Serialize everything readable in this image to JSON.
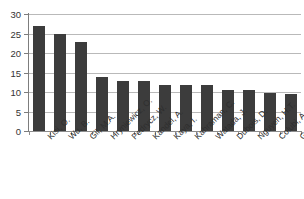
{
  "chart_data": {
    "type": "bar",
    "title": "",
    "subtitle": "",
    "xlabel": "",
    "ylabel": "",
    "ylim": [
      0,
      30
    ],
    "yticks": [
      0,
      5,
      10,
      15,
      20,
      25,
      30
    ],
    "ytick_labels": [
      "0",
      "5",
      "10",
      "15",
      "20",
      "25",
      "30"
    ],
    "grid": "horizontal",
    "legend": "none",
    "orientation": "vertical",
    "bar_color": "#3c3c3c",
    "gridline_color": "#b9b9b9",
    "axis_color": "#7d7d7d",
    "categories": [
      "Kisi, O.",
      "Wu, B.",
      "Gil, M.A.",
      "Hryniewicz, O.",
      "Pedrycz, W.",
      "Kandel, A.",
      "Kaya, I.",
      "Kahraman, C.",
      "Watada, J.",
      "Dubois, D.",
      "Nguyen, H.T.",
      "Colubi, A.",
      "Gader, P."
    ],
    "values": [
      26.8,
      24.9,
      22.8,
      13.9,
      12.8,
      12.8,
      11.8,
      11.7,
      11.7,
      10.6,
      10.6,
      9.7,
      9.6
    ]
  }
}
